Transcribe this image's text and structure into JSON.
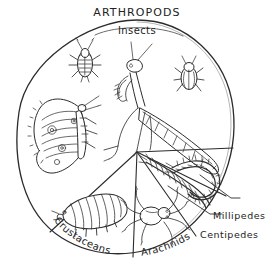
{
  "diagram": {
    "title": "ARTHROPODS",
    "style": "hand-drawn pen and ink circle chart",
    "center_label": "Insects",
    "sections": [
      {
        "id": "insects",
        "label": "Insects",
        "position": "top-inside-arc"
      },
      {
        "id": "crustaceans",
        "label": "Crustaceans",
        "position": "bottom-left-arc"
      },
      {
        "id": "arachnids",
        "label": "Arachnids",
        "position": "bottom-center-arc"
      },
      {
        "id": "centipedes",
        "label": "Centipedes",
        "position": "right-outside"
      },
      {
        "id": "millipedes",
        "label": "Millipedes",
        "position": "right-outside-upper"
      }
    ],
    "creatures": [
      {
        "name": "cockroach",
        "group": "Insects"
      },
      {
        "name": "praying-mantis",
        "group": "Insects"
      },
      {
        "name": "beetle",
        "group": "Insects"
      },
      {
        "name": "butterfly",
        "group": "Insects"
      },
      {
        "name": "woodlouse",
        "group": "Crustaceans"
      },
      {
        "name": "spider",
        "group": "Arachnids"
      },
      {
        "name": "centipede",
        "group": "Centipedes"
      },
      {
        "name": "millipede",
        "group": "Millipedes"
      }
    ],
    "colors": {
      "ink": "#2b2b2b",
      "background": "#ffffff"
    }
  }
}
